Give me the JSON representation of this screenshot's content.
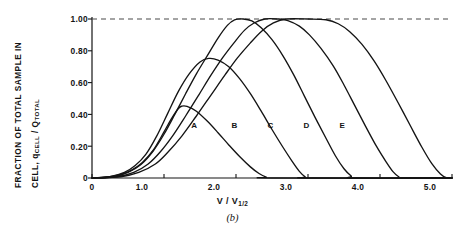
{
  "figure": {
    "caption": "(b)",
    "background_color": "#ffffff",
    "ink_color": "#141414"
  },
  "chart_data": {
    "type": "line",
    "title": "",
    "xlabel": "V / V",
    "xlabel_sub": "1/2",
    "ylabel_line1": "FRACTION OF TOTAL SAMPLE IN",
    "ylabel_line2_a": "CELL, q",
    "ylabel_line2_sub1": "CELL",
    "ylabel_line2_b": " / Q",
    "ylabel_line2_sub2": "TOTAL",
    "xlim": [
      0,
      5.0
    ],
    "ylim": [
      0,
      1.0
    ],
    "grid": false,
    "legend": "inline-curve-labels",
    "xticks": [
      0,
      1.0,
      2.0,
      3.0,
      4.0,
      5.0
    ],
    "xticklabels": [
      "0",
      "1.0",
      "2.0",
      "3.0",
      "4.0",
      "5.0"
    ],
    "yticks": [
      0,
      0.2,
      0.4,
      0.6,
      0.8,
      1.0
    ],
    "yticklabels": [
      "0",
      "0.20",
      "0.40",
      "0.60",
      "0.80",
      "1.00"
    ],
    "reference_line": {
      "y": 1.0,
      "style": "dashed",
      "label": "1.00"
    },
    "series": [
      {
        "name": "A",
        "label_x": 1.42,
        "label_y": 0.33,
        "peak_value": 0.45,
        "peak_x": 1.25,
        "points": [
          [
            0.0,
            0.0
          ],
          [
            0.2,
            0.005
          ],
          [
            0.4,
            0.022
          ],
          [
            0.55,
            0.05
          ],
          [
            0.7,
            0.098
          ],
          [
            0.85,
            0.175
          ],
          [
            1.0,
            0.29
          ],
          [
            1.1,
            0.37
          ],
          [
            1.2,
            0.437
          ],
          [
            1.25,
            0.452
          ],
          [
            1.32,
            0.45
          ],
          [
            1.45,
            0.42
          ],
          [
            1.6,
            0.358
          ],
          [
            1.75,
            0.285
          ],
          [
            1.9,
            0.208
          ],
          [
            2.05,
            0.135
          ],
          [
            2.2,
            0.07
          ],
          [
            2.32,
            0.028
          ],
          [
            2.42,
            0.006
          ],
          [
            2.5,
            0.0
          ],
          [
            5.0,
            0.0
          ]
        ]
      },
      {
        "name": "B",
        "label_x": 1.98,
        "label_y": 0.33,
        "peak_value": 0.75,
        "peak_x": 1.62,
        "points": [
          [
            0.0,
            0.0
          ],
          [
            0.25,
            0.008
          ],
          [
            0.45,
            0.035
          ],
          [
            0.6,
            0.078
          ],
          [
            0.75,
            0.15
          ],
          [
            0.9,
            0.265
          ],
          [
            1.05,
            0.405
          ],
          [
            1.2,
            0.545
          ],
          [
            1.35,
            0.655
          ],
          [
            1.5,
            0.73
          ],
          [
            1.62,
            0.752
          ],
          [
            1.75,
            0.742
          ],
          [
            1.9,
            0.7
          ],
          [
            2.05,
            0.625
          ],
          [
            2.2,
            0.53
          ],
          [
            2.35,
            0.42
          ],
          [
            2.5,
            0.305
          ],
          [
            2.65,
            0.195
          ],
          [
            2.78,
            0.105
          ],
          [
            2.88,
            0.042
          ],
          [
            2.96,
            0.008
          ],
          [
            3.02,
            0.0
          ],
          [
            5.0,
            0.0
          ]
        ]
      },
      {
        "name": "C",
        "label_x": 2.48,
        "label_y": 0.33,
        "peak_value": 1.0,
        "peak_x": 2.05,
        "plateau": [
          1.92,
          2.2
        ],
        "points": [
          [
            0.0,
            0.0
          ],
          [
            0.3,
            0.008
          ],
          [
            0.5,
            0.035
          ],
          [
            0.68,
            0.085
          ],
          [
            0.85,
            0.17
          ],
          [
            1.0,
            0.275
          ],
          [
            1.15,
            0.4
          ],
          [
            1.3,
            0.53
          ],
          [
            1.45,
            0.655
          ],
          [
            1.6,
            0.768
          ],
          [
            1.75,
            0.88
          ],
          [
            1.88,
            0.96
          ],
          [
            1.98,
            0.995
          ],
          [
            2.1,
            1.0
          ],
          [
            2.22,
            0.988
          ],
          [
            2.35,
            0.945
          ],
          [
            2.5,
            0.87
          ],
          [
            2.65,
            0.77
          ],
          [
            2.8,
            0.65
          ],
          [
            2.95,
            0.515
          ],
          [
            3.1,
            0.38
          ],
          [
            3.25,
            0.25
          ],
          [
            3.38,
            0.14
          ],
          [
            3.5,
            0.058
          ],
          [
            3.6,
            0.012
          ],
          [
            3.66,
            0.0
          ],
          [
            5.0,
            0.0
          ]
        ]
      },
      {
        "name": "D",
        "label_x": 2.98,
        "label_y": 0.33,
        "peak_value": 1.0,
        "peak_x": 2.45,
        "plateau": [
          2.18,
          2.72
        ],
        "points": [
          [
            0.0,
            0.0
          ],
          [
            0.35,
            0.008
          ],
          [
            0.58,
            0.035
          ],
          [
            0.78,
            0.088
          ],
          [
            0.95,
            0.165
          ],
          [
            1.12,
            0.265
          ],
          [
            1.3,
            0.39
          ],
          [
            1.48,
            0.52
          ],
          [
            1.65,
            0.645
          ],
          [
            1.82,
            0.76
          ],
          [
            1.98,
            0.855
          ],
          [
            2.12,
            0.93
          ],
          [
            2.25,
            0.975
          ],
          [
            2.4,
            1.0
          ],
          [
            2.58,
            1.0
          ],
          [
            2.72,
            0.99
          ],
          [
            2.88,
            0.955
          ],
          [
            3.02,
            0.9
          ],
          [
            3.18,
            0.815
          ],
          [
            3.35,
            0.705
          ],
          [
            3.5,
            0.585
          ],
          [
            3.65,
            0.455
          ],
          [
            3.8,
            0.325
          ],
          [
            3.95,
            0.2
          ],
          [
            4.08,
            0.105
          ],
          [
            4.18,
            0.04
          ],
          [
            4.26,
            0.008
          ],
          [
            4.32,
            0.0
          ],
          [
            5.0,
            0.0
          ]
        ]
      },
      {
        "name": "E",
        "label_x": 3.48,
        "label_y": 0.33,
        "peak_value": 1.0,
        "peak_x": 2.9,
        "plateau": [
          2.45,
          3.35
        ],
        "points": [
          [
            0.0,
            0.0
          ],
          [
            0.4,
            0.008
          ],
          [
            0.65,
            0.035
          ],
          [
            0.88,
            0.088
          ],
          [
            1.05,
            0.16
          ],
          [
            1.25,
            0.265
          ],
          [
            1.45,
            0.39
          ],
          [
            1.65,
            0.52
          ],
          [
            1.85,
            0.65
          ],
          [
            2.02,
            0.755
          ],
          [
            2.2,
            0.85
          ],
          [
            2.36,
            0.925
          ],
          [
            2.52,
            0.975
          ],
          [
            2.7,
            1.0
          ],
          [
            3.0,
            1.0
          ],
          [
            3.25,
            0.995
          ],
          [
            3.42,
            0.97
          ],
          [
            3.58,
            0.92
          ],
          [
            3.75,
            0.84
          ],
          [
            3.92,
            0.735
          ],
          [
            4.08,
            0.615
          ],
          [
            4.25,
            0.475
          ],
          [
            4.42,
            0.33
          ],
          [
            4.58,
            0.195
          ],
          [
            4.72,
            0.09
          ],
          [
            4.84,
            0.025
          ],
          [
            4.92,
            0.002
          ],
          [
            5.0,
            0.0
          ]
        ]
      }
    ]
  }
}
